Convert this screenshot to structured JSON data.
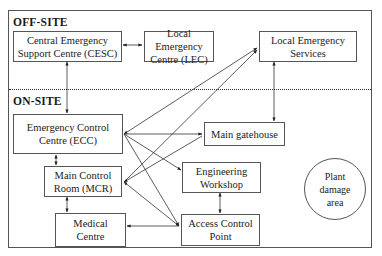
{
  "sections": {
    "off_site": "OFF-SITE",
    "on_site": "ON-SITE"
  },
  "nodes": {
    "cesc": "Central Emergency\nSupport Centre (CESC)",
    "lec": "Local Emergency\nCentre (LEC)",
    "les": "Local Emergency\nServices",
    "ecc": "Emergency Control\nCentre (ECC)",
    "mcr": "Main Control\nRoom (MCR)",
    "medical": "Medical\nCentre",
    "gatehouse": "Main gatehouse",
    "workshop": "Engineering\nWorkshop",
    "acp": "Access Control\nPoint",
    "damage": "Plant\ndamage\narea"
  },
  "edges": [
    {
      "from": "cesc",
      "to": "lec",
      "direction": "both"
    },
    {
      "from": "cesc",
      "to": "ecc",
      "direction": "both"
    },
    {
      "from": "les",
      "to": "gatehouse",
      "direction": "both"
    },
    {
      "from": "ecc",
      "to": "les",
      "direction": "both"
    },
    {
      "from": "mcr",
      "to": "les",
      "direction": "both"
    },
    {
      "from": "ecc",
      "to": "gatehouse",
      "direction": "both"
    },
    {
      "from": "ecc",
      "to": "workshop",
      "direction": "both"
    },
    {
      "from": "ecc",
      "to": "acp",
      "direction": "both"
    },
    {
      "from": "ecc",
      "to": "mcr",
      "direction": "both"
    },
    {
      "from": "mcr",
      "to": "gatehouse",
      "direction": "both"
    },
    {
      "from": "mcr",
      "to": "acp",
      "direction": "both"
    },
    {
      "from": "mcr",
      "to": "medical",
      "direction": "both"
    },
    {
      "from": "acp",
      "to": "medical",
      "direction": "both"
    },
    {
      "from": "workshop",
      "to": "acp",
      "direction": "both"
    }
  ],
  "colors": {
    "line": "#333333",
    "border": "#555555",
    "background": "#ffffff"
  }
}
